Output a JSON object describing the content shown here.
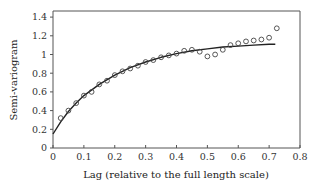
{
  "chart_data": {
    "type": "scatter",
    "title": "",
    "xlabel": "Lag (relative to the full length scale)",
    "ylabel": "Semi-variogram",
    "xlim": [
      0,
      0.8
    ],
    "ylim": [
      0,
      1.4
    ],
    "xticks": [
      "0",
      "0.1",
      "0.2",
      "0.3",
      "0.4",
      "0.5",
      "0.6",
      "0.7",
      "0.8"
    ],
    "yticks": [
      "0",
      "0.2",
      "0.4",
      "0.6",
      "0.8",
      "1",
      "1.2",
      "1.4"
    ],
    "grid": false,
    "legend": null,
    "series": [
      {
        "name": "Empirical semi-variogram",
        "style": "open-circle",
        "x": [
          0.025,
          0.05,
          0.075,
          0.1,
          0.125,
          0.15,
          0.175,
          0.2,
          0.225,
          0.25,
          0.275,
          0.3,
          0.325,
          0.35,
          0.375,
          0.4,
          0.425,
          0.45,
          0.475,
          0.5,
          0.525,
          0.55,
          0.575,
          0.6,
          0.625,
          0.65,
          0.675,
          0.7,
          0.725
        ],
        "y": [
          0.32,
          0.4,
          0.48,
          0.56,
          0.6,
          0.68,
          0.72,
          0.78,
          0.82,
          0.85,
          0.88,
          0.92,
          0.94,
          0.97,
          0.99,
          1.01,
          1.04,
          1.05,
          1.03,
          0.98,
          1.0,
          1.05,
          1.1,
          1.12,
          1.14,
          1.15,
          1.16,
          1.18,
          1.28
        ]
      },
      {
        "name": "Fitted model",
        "style": "solid-line",
        "x": [
          0,
          0.025,
          0.05,
          0.075,
          0.1,
          0.15,
          0.2,
          0.25,
          0.3,
          0.35,
          0.4,
          0.45,
          0.5,
          0.55,
          0.6,
          0.65,
          0.7,
          0.72
        ],
        "y": [
          0.15,
          0.28,
          0.39,
          0.48,
          0.56,
          0.68,
          0.78,
          0.86,
          0.92,
          0.97,
          1.01,
          1.04,
          1.06,
          1.08,
          1.09,
          1.1,
          1.11,
          1.11
        ]
      }
    ]
  }
}
